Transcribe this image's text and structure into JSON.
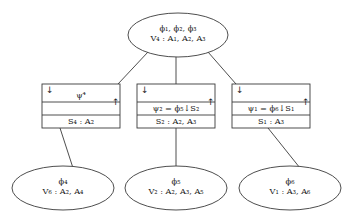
{
  "figure": {
    "type": "diagram",
    "background_color": "#ffffff",
    "stroke_color": "#3a3a3a"
  },
  "root_node": {
    "name": "root-ellipse",
    "line1": "ϕ₁, ϕ₂, ϕ₃",
    "line2": "V₄ : A₁, A₂, A₃",
    "cx": 178,
    "cy": 35,
    "rx": 50,
    "ry": 22
  },
  "boxes": [
    {
      "name": "separator-box-left",
      "id": "box-1",
      "x": 42,
      "y": 84,
      "width": 78,
      "height": 44,
      "row_dividers": [
        18,
        31
      ],
      "down_arrow": "↓",
      "up_arrow": "↑",
      "row1": "ψ⁴",
      "row2": "",
      "row3": "S₄ : A₂"
    },
    {
      "name": "separator-box-middle",
      "id": "box-2",
      "x": 137,
      "y": 84,
      "width": 78,
      "height": 44,
      "row_dividers": [
        18,
        31
      ],
      "down_arrow": "↓",
      "up_arrow": "↑",
      "row1": "",
      "row2": "ψ₂ = ϕ₅↓S₂",
      "row3": "S₂ : A₂, A₃"
    },
    {
      "name": "separator-box-right",
      "id": "box-3",
      "x": 232,
      "y": 84,
      "width": 78,
      "height": 44,
      "row_dividers": [
        18,
        31
      ],
      "down_arrow": "↓",
      "up_arrow": "↑",
      "row1": "",
      "row2": "ψ₁ = ϕ₆↓S₁",
      "row3": "S₁ : A₃"
    }
  ],
  "leaf_nodes": [
    {
      "name": "leaf-ellipse-left",
      "line1": "ϕ₄",
      "line2": "V₆ : A₂, A₄",
      "cx": 63,
      "cy": 188,
      "rx": 51,
      "ry": 22
    },
    {
      "name": "leaf-ellipse-middle",
      "line1": "ϕ₅",
      "line2": "V₂ : A₂, A₃, A₅",
      "cx": 176,
      "cy": 188,
      "rx": 51,
      "ry": 22
    },
    {
      "name": "leaf-ellipse-right",
      "line1": "ϕ₆",
      "line2": "V₁ : A₃, A₆",
      "cx": 290,
      "cy": 188,
      "rx": 51,
      "ry": 22
    }
  ],
  "edges": [
    {
      "name": "edge-root-to-box-left",
      "x1": 148,
      "y1": 52,
      "x2": 118,
      "y2": 84
    },
    {
      "name": "edge-root-to-box-middle",
      "x1": 176,
      "y1": 57,
      "x2": 176,
      "y2": 84
    },
    {
      "name": "edge-root-to-box-right",
      "x1": 208,
      "y1": 52,
      "x2": 236,
      "y2": 84
    },
    {
      "name": "edge-box-left-to-leaf",
      "x1": 60,
      "y1": 128,
      "x2": 73,
      "y2": 168
    },
    {
      "name": "edge-box-middle-to-leaf",
      "x1": 176,
      "y1": 128,
      "x2": 176,
      "y2": 167
    },
    {
      "name": "edge-box-right-to-leaf",
      "x1": 268,
      "y1": 128,
      "x2": 300,
      "y2": 168
    }
  ]
}
